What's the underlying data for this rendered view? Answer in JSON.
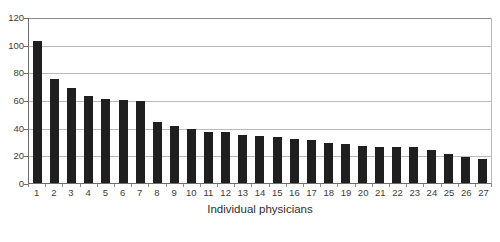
{
  "chart_data": {
    "type": "bar",
    "title": "",
    "subtitle": "",
    "xlabel": "Individual physicians",
    "ylabel": "",
    "categories": [
      "1",
      "2",
      "3",
      "4",
      "5",
      "6",
      "7",
      "8",
      "9",
      "10",
      "11",
      "12",
      "13",
      "14",
      "15",
      "16",
      "17",
      "18",
      "19",
      "20",
      "21",
      "22",
      "23",
      "24",
      "25",
      "26",
      "27"
    ],
    "values": [
      103,
      75,
      69,
      63,
      61,
      60,
      59,
      44,
      41,
      39,
      37,
      37,
      35,
      34,
      33,
      32,
      31,
      29,
      28,
      27,
      26,
      26,
      26,
      24,
      21,
      19,
      17
    ],
    "series": [
      {
        "name": "Cases per physician",
        "values": [
          103,
          75,
          69,
          63,
          61,
          60,
          59,
          44,
          41,
          39,
          37,
          37,
          35,
          34,
          33,
          32,
          31,
          29,
          28,
          27,
          26,
          26,
          26,
          24,
          21,
          19,
          17
        ]
      }
    ],
    "ylim": [
      0,
      120
    ],
    "yticks": [
      0,
      20,
      40,
      60,
      80,
      100,
      120
    ],
    "ytick_labels": [
      "0",
      "20",
      "40",
      "60",
      "80",
      "100",
      "120"
    ],
    "xtick_labels": [
      "1",
      "2",
      "3",
      "4",
      "5",
      "6",
      "7",
      "8",
      "9",
      "10",
      "11",
      "12",
      "13",
      "14",
      "15",
      "16",
      "17",
      "18",
      "19",
      "20",
      "21",
      "22",
      "23",
      "24",
      "25",
      "26",
      "27"
    ],
    "grid": true,
    "grid_axis": "y",
    "legend": false,
    "legend_position": "none",
    "bar_color": "#1f1f1f",
    "gridline_color": "#b9b9b9",
    "axis_color": "#6e6e6e",
    "background_color": "#ffffff"
  }
}
